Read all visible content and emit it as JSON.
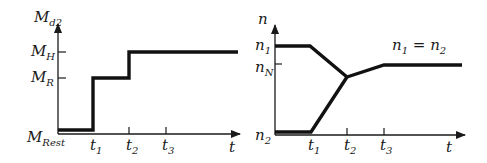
{
  "left_plot": {
    "y_axis_label": "M",
    "y_axis_sub": "d2",
    "x_axis_label": "t",
    "y_ticks": [
      {
        "label": "M",
        "sub": "H"
      },
      {
        "label": "M",
        "sub": "R"
      },
      {
        "label": "M",
        "sub": "Rest"
      }
    ],
    "x_ticks": [
      {
        "label": "t",
        "sub": "1"
      },
      {
        "label": "t",
        "sub": "2"
      },
      {
        "label": "t",
        "sub": "3"
      }
    ]
  },
  "right_plot": {
    "y_axis_label": "n",
    "x_axis_label": "t",
    "y_ticks": [
      {
        "label": "n",
        "sub": "1"
      },
      {
        "label": "n",
        "sub": "N"
      },
      {
        "label": "n",
        "sub": "2"
      }
    ],
    "x_ticks": [
      {
        "label": "t",
        "sub": "1"
      },
      {
        "label": "t",
        "sub": "2"
      },
      {
        "label": "t",
        "sub": "3"
      }
    ],
    "annotation": {
      "a": "n",
      "a_sub": "1",
      "eq": " = ",
      "b": "n",
      "b_sub": "2"
    }
  }
}
